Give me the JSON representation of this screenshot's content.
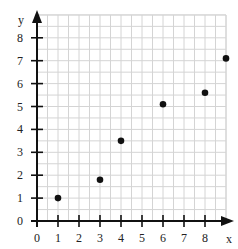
{
  "chart_data": {
    "type": "scatter",
    "title": "",
    "xlabel": "x",
    "ylabel": "y",
    "xlim": [
      0,
      9
    ],
    "ylim": [
      0,
      8.5
    ],
    "grid": true,
    "grid_step": 0.5,
    "x_ticks": [
      "0",
      "1",
      "2",
      "3",
      "4",
      "5",
      "6",
      "7",
      "8"
    ],
    "y_ticks": [
      "0",
      "1",
      "2",
      "3",
      "4",
      "5",
      "6",
      "7",
      "8"
    ],
    "legend": null,
    "series": [
      {
        "name": "points",
        "x": [
          1,
          3,
          4,
          6,
          8,
          9
        ],
        "y": [
          1,
          1.8,
          3.5,
          5.1,
          5.6,
          7.1
        ]
      }
    ],
    "colors": {
      "grid": "#d4d4d4",
      "axis": "#111111",
      "point": "#111111"
    }
  }
}
